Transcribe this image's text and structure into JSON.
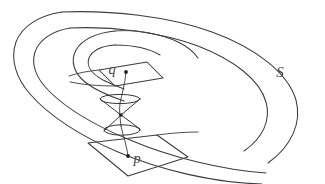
{
  "figure": {
    "name": "spiral-spacetime-surface",
    "background_color": "#ffffff",
    "stroke_color": "#3b3b42",
    "dot_color": "#1d1d22",
    "label_color": "#46464d"
  },
  "labels": {
    "surface": "S",
    "upper_point": "q",
    "lower_point": "p"
  },
  "elements": {
    "surface_label_name": "surface-label-S",
    "upper_flag_name": "upper-tangent-plane-flag",
    "lower_flag_name": "lower-tangent-plane-flag",
    "light_cone_name": "double-light-cone",
    "worldline_name": "worldline-curve-p-to-q",
    "spiral_band_name": "spiral-band-surface"
  },
  "geometry": {
    "upper_point_xy": [
      126,
      72
    ],
    "lower_point_xy": [
      128,
      156
    ],
    "cone_apex_xy": [
      120,
      114
    ],
    "canvas": [
      325,
      184
    ]
  }
}
